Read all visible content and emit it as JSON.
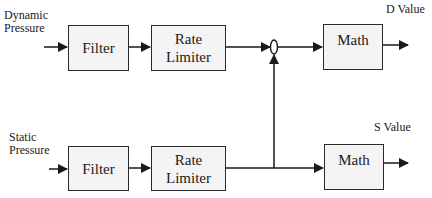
{
  "diagram": {
    "type": "block-diagram",
    "rows": [
      {
        "input_label": [
          "Dynamic",
          "Pressure"
        ],
        "blocks": [
          "Filter",
          "Rate Limiter"
        ],
        "output_block": "Math",
        "output_label": "D Value"
      },
      {
        "input_label": [
          "Static",
          "Pressure"
        ],
        "blocks": [
          "Filter",
          "Rate Limiter"
        ],
        "output_block": "Math",
        "output_label": "S Value"
      }
    ],
    "top": {
      "input_line1": "Dynamic",
      "input_line2": "Pressure",
      "filter": "Filter",
      "rate_line1": "Rate",
      "rate_line2": "Limiter",
      "math": "Math",
      "output": "D Value"
    },
    "bottom": {
      "input_line1": "Static",
      "input_line2": "Pressure",
      "filter": "Filter",
      "rate_line1": "Rate",
      "rate_line2": "Limiter",
      "math": "Math",
      "output": "S Value"
    },
    "junction": "summing-node (ellipse) combining top rate limiter output with bottom rate limiter output",
    "colors": {
      "stroke": "#2a2a2a",
      "box_fill": "#f4f4f4",
      "background": "#ffffff"
    }
  }
}
